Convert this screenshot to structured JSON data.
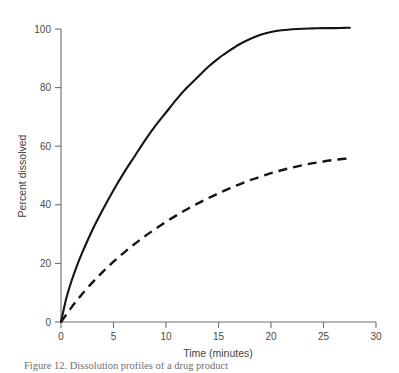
{
  "figure": {
    "caption": "Figure 12.  Dissolution profiles of a drug product",
    "background_color": "#ffffff",
    "axis_color": "#6d6d6d",
    "series_color": "#141414"
  },
  "chart_data": {
    "type": "line",
    "title": "",
    "subtitle": "",
    "xlabel": "Time (minutes)",
    "ylabel": "Percent dissolved",
    "xlim": [
      0,
      30
    ],
    "ylim": [
      0,
      105
    ],
    "xticks": [
      0,
      5,
      10,
      15,
      20,
      25,
      30
    ],
    "xtick_labels": [
      "0",
      "5",
      "10",
      "15",
      "20",
      "25",
      "30"
    ],
    "yticks": [
      0,
      20,
      40,
      60,
      80,
      100
    ],
    "ytick_labels": [
      "0",
      "20",
      "40",
      "60",
      "80",
      "100"
    ],
    "grid": false,
    "legend": false,
    "legend_position": "none",
    "annotations": [],
    "x": [
      0,
      0.5,
      1,
      1.5,
      2,
      3,
      4,
      5,
      6,
      7,
      8,
      9,
      10,
      11,
      12,
      13,
      14,
      15,
      16,
      17,
      18,
      19,
      20,
      21,
      22,
      23,
      24,
      25,
      26,
      27,
      27.5
    ],
    "series": [
      {
        "name": "Reference (solid)",
        "style": "solid",
        "values": [
          0,
          8.0,
          14.0,
          19.0,
          23.5,
          31.5,
          38.5,
          45.0,
          51.0,
          56.5,
          62.0,
          67.0,
          71.5,
          76.0,
          80.0,
          83.5,
          87.0,
          90.0,
          92.5,
          94.8,
          96.6,
          98.0,
          99.0,
          99.6,
          99.9,
          100.1,
          100.2,
          100.3,
          100.3,
          100.4,
          100.4
        ]
      },
      {
        "name": "Test (dashed)",
        "style": "dashed",
        "values": [
          0,
          2.5,
          5.0,
          7.3,
          9.5,
          13.5,
          17.2,
          20.6,
          23.7,
          26.6,
          29.3,
          31.8,
          34.2,
          36.4,
          38.5,
          40.4,
          42.2,
          43.9,
          45.5,
          47.0,
          48.4,
          49.6,
          50.8,
          51.8,
          52.7,
          53.5,
          54.2,
          54.8,
          55.3,
          55.7,
          55.9
        ]
      }
    ]
  }
}
